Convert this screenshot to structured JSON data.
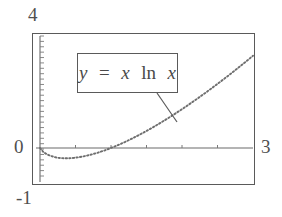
{
  "figure": {
    "background_color": "#ffffff",
    "line_color": "#5a5a5a",
    "text_color": "#4a4a4a"
  },
  "annotation": {
    "equation_box": {
      "lhs": "y",
      "equals": "=",
      "rhs_var": "x",
      "rhs_fn": "ln",
      "rhs_arg": "x",
      "full_text": "y = x ln x"
    },
    "leader_line": {
      "from_x": 157,
      "from_y": 93,
      "to_x": 177,
      "to_y": 122
    }
  },
  "chart_data": {
    "type": "line",
    "title": "",
    "xlabel": "",
    "ylabel": "",
    "equation": "y = x ln x",
    "xlim": [
      0,
      3
    ],
    "ylim": [
      -1,
      4
    ],
    "grid": false,
    "legend": null,
    "linestyle": "dotted",
    "tick_labels": {
      "y_top": "4",
      "y_zero": "0",
      "y_bottom": "-1",
      "x_right": "3"
    },
    "x_tick_count": 6,
    "y_tick_count": 26,
    "annotations": [
      {
        "text": "y = x ln x",
        "x": 0.95,
        "y": 2.45
      }
    ],
    "x": [
      0.0,
      0.05,
      0.1,
      0.15,
      0.2,
      0.25,
      0.3,
      0.3679,
      0.4,
      0.45,
      0.5,
      0.6,
      0.7,
      0.8,
      0.9,
      1.0,
      1.1,
      1.2,
      1.3,
      1.4,
      1.5,
      1.6,
      1.7,
      1.8,
      1.9,
      2.0,
      2.1,
      2.2,
      2.3,
      2.4,
      2.5,
      2.6,
      2.7,
      2.8,
      2.9,
      3.0
    ],
    "values": [
      0.0,
      -0.15,
      -0.23,
      -0.28,
      -0.32,
      -0.35,
      -0.36,
      -0.3679,
      -0.3665,
      -0.359,
      -0.3466,
      -0.3065,
      -0.2497,
      -0.1785,
      -0.0949,
      0.0,
      0.1048,
      0.2188,
      0.3411,
      0.471,
      0.6082,
      0.752,
      0.9021,
      1.058,
      1.2196,
      1.3863,
      1.558,
      1.7344,
      1.9153,
      2.1005,
      2.2897,
      2.4829,
      2.6798,
      2.8803,
      3.0843,
      3.2958
    ]
  }
}
